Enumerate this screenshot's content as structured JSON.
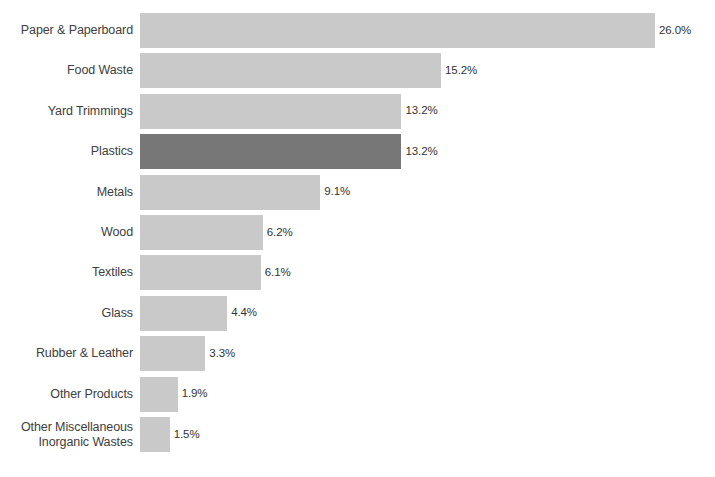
{
  "chart_data": {
    "type": "bar",
    "orientation": "horizontal",
    "title": "",
    "subtitle": "",
    "xlabel": "",
    "ylabel": "",
    "xlim": [
      0,
      26.0
    ],
    "grid": false,
    "legend": null,
    "value_suffix": "%",
    "categories": [
      "Paper & Paperboard",
      "Food Waste",
      "Yard Trimmings",
      "Plastics",
      "Metals",
      "Wood",
      "Textiles",
      "Glass",
      "Rubber & Leather",
      "Other Products",
      "Other Miscellaneous\nInorganic Wastes"
    ],
    "values": [
      26.0,
      15.2,
      13.2,
      13.2,
      9.1,
      6.2,
      6.1,
      4.4,
      3.3,
      1.9,
      1.5
    ],
    "data_labels": [
      "26.0%",
      "15.2%",
      "13.2%",
      "13.2%",
      "9.1%",
      "6.2%",
      "6.1%",
      "4.4%",
      "3.3%",
      "1.9%",
      "1.5%"
    ],
    "highlight_index": 3,
    "colors": {
      "bar": "#c9c9c9",
      "bar_highlight": "#777777",
      "label_text": "#404040",
      "value_text": "#333333",
      "background": "#ffffff"
    }
  }
}
